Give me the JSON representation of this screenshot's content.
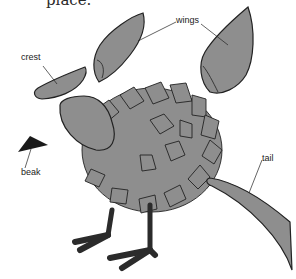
{
  "caption": {
    "text": "place."
  },
  "labels": {
    "wings": "wings",
    "crest": "crest",
    "beak": "beak",
    "tail": "tail"
  },
  "colors": {
    "part_fill": "#8e8e8e",
    "outline": "#222222",
    "beak": "#1a1a1a",
    "legs": "#2b2b2b",
    "background": "#ffffff"
  }
}
